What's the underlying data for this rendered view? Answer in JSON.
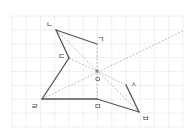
{
  "figure": {
    "grid": {
      "x0": 12,
      "y0": 16,
      "x1": 183,
      "y1": 127,
      "cols": 12,
      "rows": 8
    },
    "colors": {
      "solid": "#555555",
      "aux": "#b4b4b4",
      "grid": "#d6d6d6",
      "center": "#888888"
    },
    "points": [
      {
        "id": "g",
        "label": "ㄱ",
        "x": 97,
        "y": 44,
        "lx": 100,
        "ly": 39
      },
      {
        "id": "n",
        "label": "ㄴ",
        "x": 56,
        "y": 30,
        "lx": 49,
        "ly": 24
      },
      {
        "id": "d",
        "label": "ㄷ",
        "x": 69,
        "y": 58,
        "lx": 61,
        "ly": 56
      },
      {
        "id": "r",
        "label": "ㄹ",
        "x": 42,
        "y": 99,
        "lx": 34,
        "ly": 106
      },
      {
        "id": "m",
        "label": "ㅁ",
        "x": 97,
        "y": 99,
        "lx": 97,
        "ly": 106
      },
      {
        "id": "b",
        "label": "ㅂ",
        "x": 139,
        "y": 112,
        "lx": 145,
        "ly": 118
      },
      {
        "id": "s",
        "label": "ㅅ",
        "x": 126,
        "y": 85,
        "lx": 133,
        "ly": 84
      },
      {
        "id": "o",
        "label": "ㅇ",
        "x": 97,
        "y": 71,
        "lx": 97,
        "ly": 79
      }
    ],
    "solid_segments": [
      [
        "g",
        "n"
      ],
      [
        "n",
        "d"
      ],
      [
        "d",
        "r"
      ],
      [
        "r",
        "m"
      ],
      [
        "m",
        "b"
      ],
      [
        "b",
        "s"
      ]
    ],
    "aux_segments": [
      {
        "from": [
          56,
          30
        ],
        "to": [
          139,
          112
        ]
      },
      {
        "from": [
          69,
          58
        ],
        "to": [
          126,
          85
        ]
      },
      {
        "from": [
          42,
          99
        ],
        "to": [
          183,
          31
        ]
      },
      {
        "from": [
          97,
          44
        ],
        "to": [
          97,
          99
        ]
      }
    ]
  }
}
